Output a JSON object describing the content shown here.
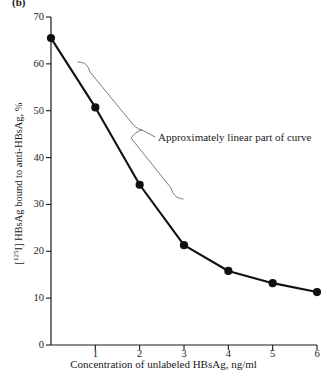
{
  "figure": {
    "panel_label": "(b)",
    "background_color": "#ffffff",
    "line_color": "#101010",
    "marker_color": "#101010",
    "axis_color": "#1a1a1a",
    "brace_color": "#6b6b6b"
  },
  "chart_data": {
    "type": "line",
    "title": "",
    "subtitle": "",
    "xlabel": "Concentration of unlabeled HBsAg, ng/ml",
    "ylabel": "[125I] HBsAg bound to anti-HBsAg, %",
    "ylabel_prefix": "[",
    "ylabel_superscript": "125",
    "ylabel_suffix": "I] HBsAg bound to anti-HBsAg, %",
    "x": [
      0,
      1,
      2,
      3,
      4,
      5,
      6
    ],
    "values": [
      65.5,
      50.7,
      34.2,
      21.3,
      15.8,
      13.2,
      11.3
    ],
    "series": [
      {
        "name": "[125I] HBsAg bound to anti-HBsAg",
        "values": [
          65.5,
          50.7,
          34.2,
          21.3,
          15.8,
          13.2,
          11.3
        ]
      }
    ],
    "xlim": [
      0,
      6
    ],
    "ylim": [
      0,
      70
    ],
    "xticks": [
      0,
      1,
      2,
      3,
      4,
      5,
      6
    ],
    "xtick_labels": [
      "",
      "1",
      "2",
      "3",
      "4",
      "5",
      "6"
    ],
    "yticks": [
      0,
      10,
      20,
      30,
      40,
      50,
      60,
      70
    ],
    "ytick_labels": [
      "0",
      "10",
      "20",
      "30",
      "40",
      "50",
      "60",
      "70"
    ],
    "grid": false,
    "legend": "none",
    "markers": "filled-circle",
    "annotations": [
      {
        "text": "Approximately linear part of curve",
        "type": "brace-callout",
        "spans_x": [
          0,
          3
        ],
        "note": "curly brace alongside the approximately linear segment from 0 to 3 ng/ml"
      }
    ]
  }
}
